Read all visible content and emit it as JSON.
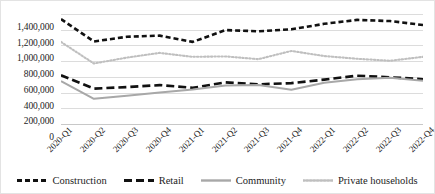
{
  "chart_data": {
    "type": "line",
    "title": "",
    "xlabel": "",
    "ylabel": "",
    "ylim": [
      0,
      1400000
    ],
    "grid": true,
    "legend_position": "bottom",
    "categories": [
      "2020-Q1",
      "2020-Q2",
      "2020-Q3",
      "2020-Q4",
      "2021-Q1",
      "2021-Q2",
      "2021-Q3",
      "2021-Q4",
      "2022-Q1",
      "2022-Q2",
      "2022-Q3",
      "2022-Q4"
    ],
    "y_ticks": [
      0,
      200000,
      400000,
      600000,
      800000,
      1000000,
      1200000,
      1400000
    ],
    "y_tick_labels": [
      "0",
      "200,000",
      "400,000",
      "600,000",
      "800,000",
      "1,000,000",
      "1,200,000",
      "1,400,000"
    ],
    "series": [
      {
        "name": "Construction",
        "style": "dashed-short",
        "color": "#111111",
        "values": [
          1335000,
          1050000,
          1110000,
          1125000,
          1045000,
          1195000,
          1180000,
          1205000,
          1275000,
          1325000,
          1310000,
          1260000
        ]
      },
      {
        "name": "Retail",
        "style": "dashed-long",
        "color": "#111111",
        "values": [
          620000,
          450000,
          470000,
          495000,
          460000,
          530000,
          505000,
          520000,
          565000,
          615000,
          595000,
          570000
        ]
      },
      {
        "name": "Community",
        "style": "solid",
        "color": "#a8a8a8",
        "values": [
          545000,
          320000,
          360000,
          400000,
          440000,
          490000,
          495000,
          435000,
          525000,
          570000,
          590000,
          550000
        ]
      },
      {
        "name": "Private households",
        "style": "dotted",
        "color": "#bfbfbf",
        "values": [
          1045000,
          770000,
          845000,
          905000,
          855000,
          860000,
          825000,
          930000,
          865000,
          830000,
          805000,
          855000
        ]
      }
    ]
  },
  "legend": {
    "items": [
      {
        "label": "Construction"
      },
      {
        "label": "Retail"
      },
      {
        "label": "Community"
      },
      {
        "label": "Private households"
      }
    ]
  }
}
